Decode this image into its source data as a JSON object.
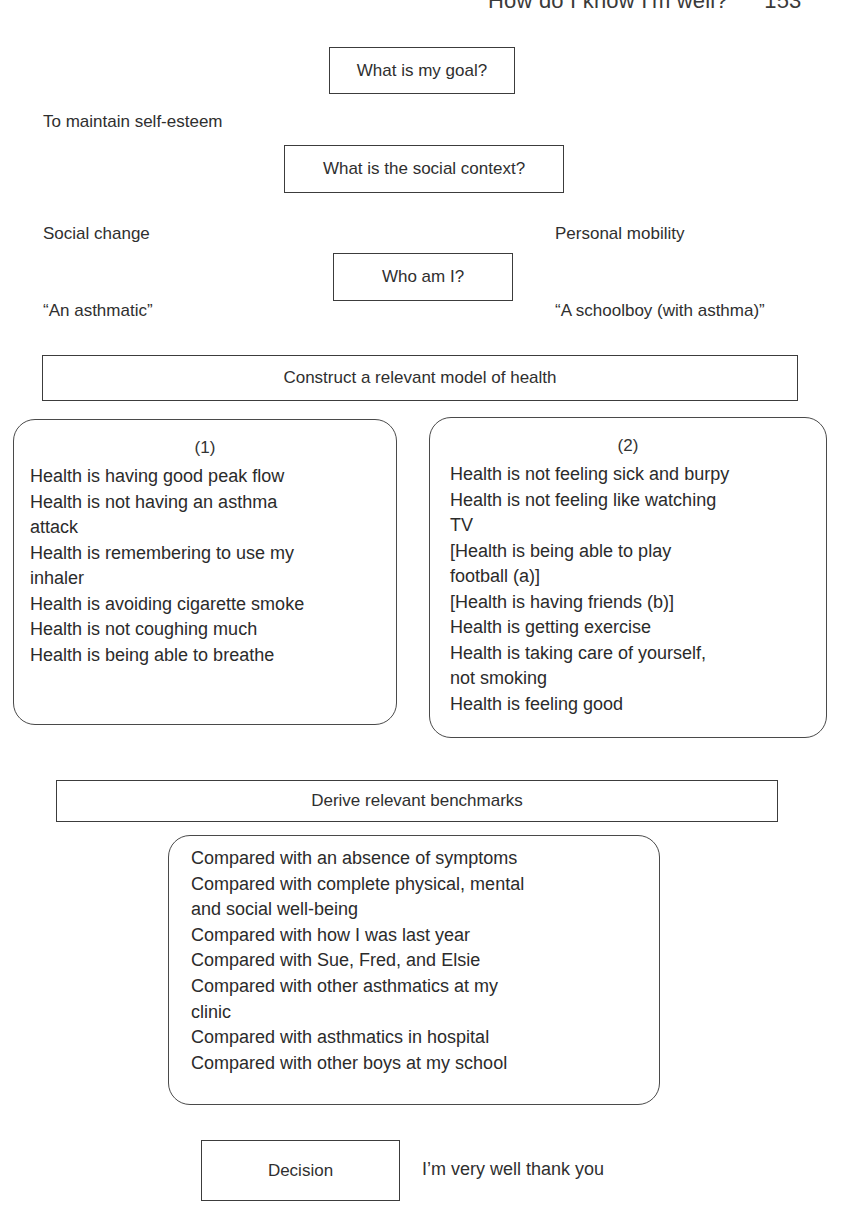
{
  "running_header": {
    "title": "How do I know I'm well?",
    "page_number": "153"
  },
  "diagram": {
    "goal": {
      "question": "What is my goal?",
      "answer": "To maintain self-esteem"
    },
    "social_context": {
      "question": "What is the social context?",
      "left": "Social change",
      "right": "Personal mobility"
    },
    "identity": {
      "question": "Who am I?",
      "left": "“An asthmatic”",
      "right": "“A schoolboy (with asthma)”"
    },
    "model_of_health": {
      "heading": "Construct a relevant model of health",
      "models": [
        {
          "number": "(1)",
          "lines": [
            "Health is having good peak flow",
            "Health is not having an asthma",
            "attack",
            "Health is remembering to use my",
            "inhaler",
            "Health is avoiding cigarette smoke",
            "Health is not coughing much",
            "Health is being able to breathe"
          ]
        },
        {
          "number": "(2)",
          "lines": [
            "Health is not feeling sick and burpy",
            "Health is not feeling like watching",
            "TV",
            "[Health is being able to play",
            "football (a)]",
            "[Health is having friends (b)]",
            "Health is getting exercise",
            "Health is taking care of yourself,",
            "not smoking",
            "Health is feeling good"
          ]
        }
      ]
    },
    "benchmarks": {
      "heading": "Derive relevant benchmarks",
      "lines": [
        "Compared with an absence of symptoms",
        "Compared with complete physical, mental",
        "and social well-being",
        "Compared with how I was last year",
        "Compared with Sue, Fred, and Elsie",
        "Compared with other asthmatics at my",
        "clinic",
        "Compared with asthmatics in hospital",
        "Compared with other boys at my school"
      ]
    },
    "decision": {
      "label": "Decision",
      "result": "I’m very well thank you"
    }
  }
}
